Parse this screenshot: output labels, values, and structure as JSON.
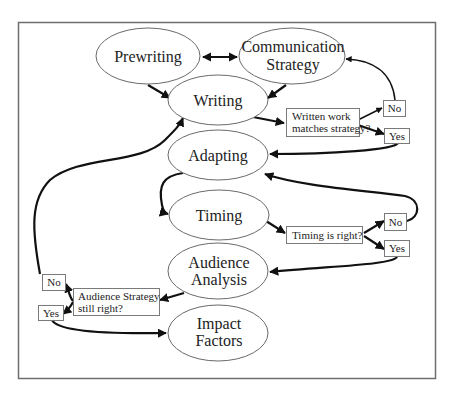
{
  "diagram": {
    "nodes": {
      "prewriting": "Prewriting",
      "communication_strategy": [
        "Communication",
        "Strategy"
      ],
      "writing": "Writing",
      "adapting": "Adapting",
      "timing": "Timing",
      "audience_analysis": [
        "Audience",
        "Analysis"
      ],
      "impact_factors": [
        "Impact",
        "Factors"
      ]
    },
    "decisions": {
      "written_work": [
        "Written work",
        "matches strategy?"
      ],
      "timing_right": "Timing is right?",
      "audience_strategy": [
        "Audience Strategy",
        "still right?"
      ]
    },
    "outcomes": {
      "no": "No",
      "yes": "Yes"
    },
    "edges": [
      {
        "from": "Prewriting",
        "to": "Communication Strategy",
        "type": "bidirectional"
      },
      {
        "from": "Prewriting",
        "to": "Writing"
      },
      {
        "from": "Communication Strategy",
        "to": "Writing"
      },
      {
        "from": "Writing",
        "to": "Written work matches strategy?"
      },
      {
        "from": "Written work matches strategy?",
        "to": "No"
      },
      {
        "from": "Written work matches strategy?",
        "to": "Yes"
      },
      {
        "from": "No",
        "to": "Communication Strategy"
      },
      {
        "from": "Yes",
        "to": "Adapting"
      },
      {
        "from": "Adapting",
        "to": "Timing"
      },
      {
        "from": "Timing",
        "to": "Timing is right?"
      },
      {
        "from": "Timing is right?",
        "to": "No"
      },
      {
        "from": "Timing is right?",
        "to": "Yes"
      },
      {
        "from": "No",
        "to": "Adapting"
      },
      {
        "from": "Yes",
        "to": "Audience Analysis"
      },
      {
        "from": "Audience Analysis",
        "to": "Audience Strategy still right?"
      },
      {
        "from": "Audience Strategy still right?",
        "to": "No"
      },
      {
        "from": "Audience Strategy still right?",
        "to": "Yes"
      },
      {
        "from": "No",
        "to": "Writing"
      },
      {
        "from": "Yes",
        "to": "Impact Factors"
      }
    ]
  }
}
